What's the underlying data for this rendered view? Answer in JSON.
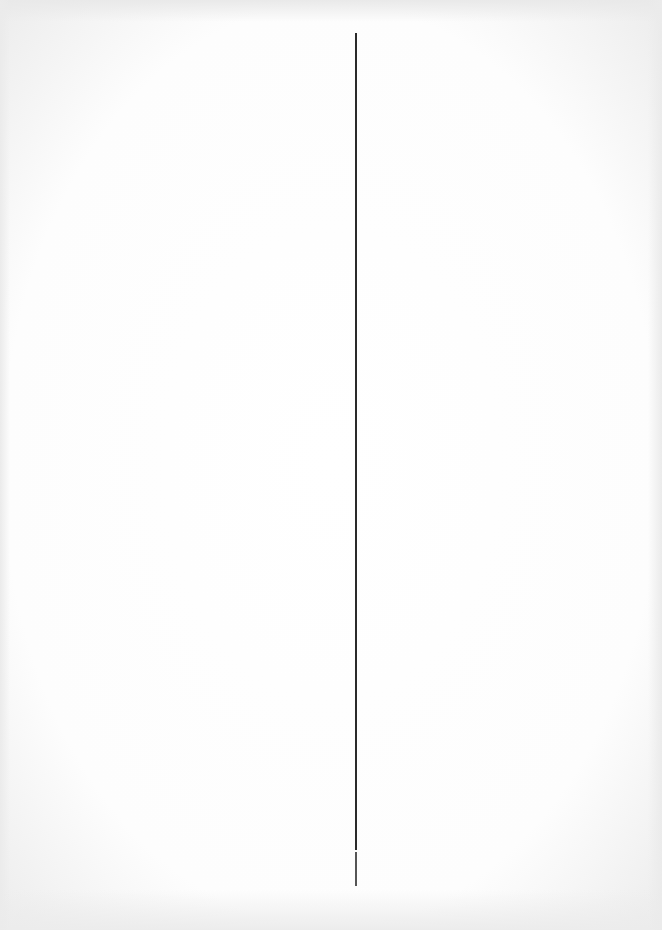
{
  "document": {
    "type": "blank scanned page",
    "divider": {
      "orientation": "vertical",
      "x": 355,
      "y_start": 33,
      "y_end": 886,
      "gap_at_y": 850,
      "color": "#2a2a2a"
    },
    "background_color": "#ffffff",
    "text": []
  }
}
